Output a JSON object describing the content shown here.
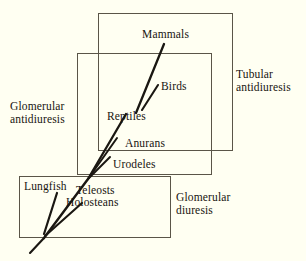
{
  "figure": {
    "background_color": "#fffff2",
    "line_color": "#1a1712",
    "box_stroke_color": "#5a5548",
    "width": 306,
    "height": 261
  },
  "regions": [
    {
      "name": "tubular-antidiuresis",
      "line1": "Tubular",
      "line2": "antidiuresis",
      "box": {
        "x": 98,
        "y": 13,
        "w": 134,
        "h": 137
      },
      "label_pos": {
        "x": 236,
        "y": 68
      }
    },
    {
      "name": "glomerular-antidiuresis",
      "line1": "Glomerular",
      "line2": "antidiuresis",
      "box": {
        "x": 77,
        "y": 53,
        "w": 134,
        "h": 121
      },
      "label_pos": {
        "x": 10,
        "y": 100
      }
    },
    {
      "name": "glomerular-diuresis",
      "line1": "Glomerular",
      "line2": "diuresis",
      "box": {
        "x": 19,
        "y": 176,
        "w": 151,
        "h": 61
      },
      "label_pos": {
        "x": 176,
        "y": 191
      }
    }
  ],
  "taxa": [
    {
      "name": "mammals",
      "label": "Mammals",
      "x": 142,
      "y": 28
    },
    {
      "name": "birds",
      "label": "Birds",
      "x": 161,
      "y": 80
    },
    {
      "name": "reptiles",
      "label": "Reptiles",
      "x": 107,
      "y": 110
    },
    {
      "name": "anurans",
      "label": "Anurans",
      "x": 125,
      "y": 137
    },
    {
      "name": "urodeles",
      "label": "Urodeles",
      "x": 113,
      "y": 158
    },
    {
      "name": "lungfish",
      "label": "Lungfish",
      "x": 24,
      "y": 180
    },
    {
      "name": "teleosts",
      "label": "Teleosts",
      "x": 76,
      "y": 184
    },
    {
      "name": "holosteans",
      "label": "Holosteans",
      "x": 66,
      "y": 196
    }
  ],
  "branches": [
    {
      "name": "trunk-lower",
      "x1": 30,
      "y1": 253,
      "x2": 44,
      "y2": 238,
      "w": 2.1
    },
    {
      "name": "trunk-main",
      "x1": 44,
      "y1": 238,
      "x2": 88,
      "y2": 179,
      "w": 2.4
    },
    {
      "name": "branch-lungfish",
      "x1": 44,
      "y1": 234,
      "x2": 57,
      "y2": 193,
      "w": 2.2
    },
    {
      "name": "branch-teleosts",
      "x1": 45,
      "y1": 236,
      "x2": 82,
      "y2": 203,
      "w": 2.1
    },
    {
      "name": "branch-urodeles",
      "x1": 88,
      "y1": 179,
      "x2": 110,
      "y2": 157,
      "w": 2.0
    },
    {
      "name": "branch-anurans",
      "x1": 88,
      "y1": 179,
      "x2": 117,
      "y2": 138,
      "w": 2.0
    },
    {
      "name": "branch-reptiles",
      "x1": 88,
      "y1": 179,
      "x2": 126,
      "y2": 114,
      "w": 2.3
    },
    {
      "name": "branch-mammals",
      "x1": 136,
      "y1": 113,
      "x2": 164,
      "y2": 44,
      "w": 2.3
    },
    {
      "name": "branch-birds",
      "x1": 142,
      "y1": 110,
      "x2": 158,
      "y2": 85,
      "w": 2.1
    }
  ]
}
